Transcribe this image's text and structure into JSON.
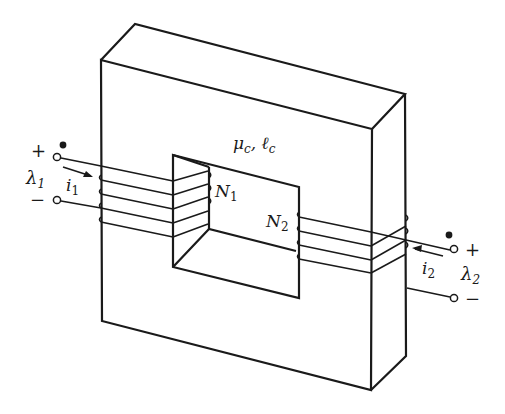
{
  "figure": {
    "core_label": "μc, ℓc",
    "core_label_main": "μ",
    "core_label_sub1": "c",
    "core_label_sep": ", ℓ",
    "core_label_sub2": "c",
    "winding1": {
      "turns_label_main": "N",
      "turns_label_sub": "1",
      "current_label_main": "i",
      "current_label_sub": "1",
      "flux_label_main": "λ",
      "flux_label_sub": "1",
      "plus": "+",
      "minus": "−"
    },
    "winding2": {
      "turns_label_main": "N",
      "turns_label_sub": "2",
      "current_label_main": "i",
      "current_label_sub": "2",
      "flux_label_main": "λ",
      "flux_label_sub": "2",
      "plus": "+",
      "minus": "−"
    },
    "colors": {
      "line": "#1a1a1a",
      "background": "#ffffff"
    }
  }
}
